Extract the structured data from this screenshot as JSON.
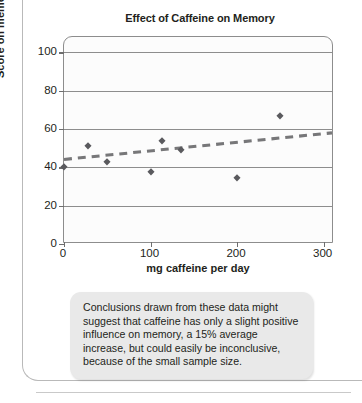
{
  "chart_data": {
    "type": "scatter",
    "title": "Effect of Caffeine on Memory",
    "xlabel": "mg caffeine per day",
    "ylabel": "Score on memory test",
    "xlim": [
      0,
      312
    ],
    "ylim": [
      0,
      108
    ],
    "xticks": [
      0,
      100,
      200,
      300
    ],
    "yticks": [
      0,
      20,
      40,
      60,
      80,
      100
    ],
    "grid": true,
    "legend": "none",
    "series": [
      {
        "name": "memory score",
        "marker": "diamond",
        "color": "#5a5a5e",
        "points": [
          {
            "x": 0,
            "y": 40
          },
          {
            "x": 28,
            "y": 51
          },
          {
            "x": 50,
            "y": 43
          },
          {
            "x": 100,
            "y": 37.5
          },
          {
            "x": 113,
            "y": 54
          },
          {
            "x": 135,
            "y": 49
          },
          {
            "x": 200,
            "y": 34.5
          },
          {
            "x": 250,
            "y": 67
          }
        ]
      },
      {
        "name": "trendline",
        "type": "line",
        "style": "dashed",
        "color": "#777779",
        "points": [
          {
            "x": 0,
            "y": 43.5
          },
          {
            "x": 312,
            "y": 57.5
          }
        ]
      }
    ]
  },
  "figure": {
    "title": "Effect of Caffeine on Memory",
    "x_axis_title": "mg caffeine per day",
    "y_axis_title": "Score on memory test",
    "x_tick_labels": [
      "0",
      "100",
      "200",
      "300"
    ],
    "y_tick_labels": [
      "0",
      "20",
      "40",
      "60",
      "80",
      "100"
    ],
    "caption": "Conclusions drawn from these data might suggest that caffeine has only a slight positive influence on memory, a 15% average increase, but could easily be inconclusive, because of the small sample size."
  },
  "colors": {
    "marker": "#5a5a5e",
    "trendline": "#777779",
    "axis": "#8d8d8d",
    "caption_background": "#e9e9e9",
    "text": "#231f20"
  }
}
